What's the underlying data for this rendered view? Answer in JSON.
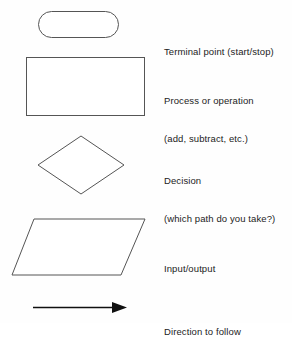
{
  "document": {
    "title": "Flowchart Symbols Legend",
    "background_color": "#fefefe",
    "text_color": "#1c1c1c",
    "shape_stroke_color": "#555555",
    "arrow_color": "#101010"
  },
  "legend": {
    "entries": [
      {
        "shape_name": "terminal",
        "shape_type": "stadium",
        "label_lines": [
          "Terminal point (start/stop)"
        ],
        "label_line_1": "Terminal point (start/stop)",
        "label_line_2": ""
      },
      {
        "shape_name": "process",
        "shape_type": "rectangle",
        "label_lines": [
          "Process or operation",
          "(add, subtract, etc.)"
        ],
        "label_line_1": "Process or operation",
        "label_line_2": "(add, subtract, etc.)"
      },
      {
        "shape_name": "decision",
        "shape_type": "diamond",
        "label_lines": [
          "Decision",
          "(which path do you take?)"
        ],
        "label_line_1": "Decision",
        "label_line_2": "(which path do you take?)"
      },
      {
        "shape_name": "input-output",
        "shape_type": "parallelogram",
        "label_lines": [
          "Input/output"
        ],
        "label_line_1": "Input/output",
        "label_line_2": ""
      },
      {
        "shape_name": "direction",
        "shape_type": "arrow",
        "label_lines": [
          "Direction to follow"
        ],
        "label_line_1": "Direction to follow",
        "label_line_2": ""
      }
    ]
  }
}
